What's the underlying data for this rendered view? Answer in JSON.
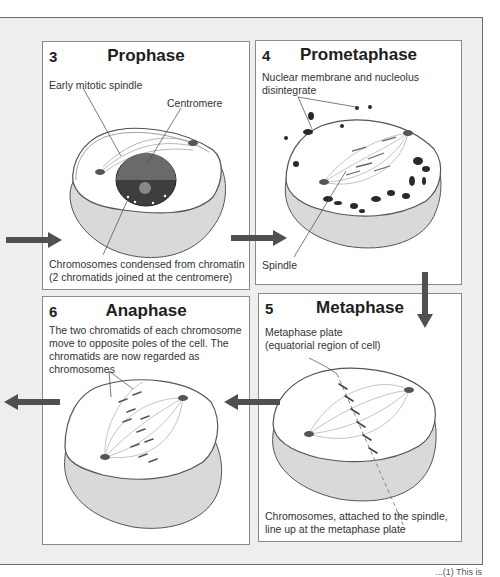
{
  "figure": {
    "panels": [
      {
        "id": "prophase",
        "number": "3",
        "title": "Prophase",
        "labels": {
          "spindle": "Early mitotic spindle",
          "centromere": "Centromere",
          "chromosomes_line1": "Chromosomes condensed from chromatin",
          "chromosomes_line2": "(2 chromatids joined at the centromere)"
        }
      },
      {
        "id": "prometaphase",
        "number": "4",
        "title": "Prometaphase",
        "labels": {
          "membrane_line1": "Nuclear membrane and nucleolus",
          "membrane_line2": "disintegrate",
          "spindle": "Spindle"
        }
      },
      {
        "id": "metaphase",
        "number": "5",
        "title": "Metaphase",
        "labels": {
          "plate_line1": "Metaphase plate",
          "plate_line2": "(equatorial region of cell)",
          "caption_line1": "Chromosomes, attached to the spindle,",
          "caption_line2": "line up at the metaphase plate"
        }
      },
      {
        "id": "anaphase",
        "number": "6",
        "title": "Anaphase",
        "labels": {
          "desc_line1": "The two chromatids of each chromosome",
          "desc_line2": "move to opposite poles of the cell.  The",
          "desc_line3": "chromatids are now regarded as",
          "desc_line4": "chromosomes"
        }
      }
    ],
    "arrows": [
      {
        "id": "into-prophase",
        "direction": "right"
      },
      {
        "id": "prophase-to-prometaphase",
        "direction": "right"
      },
      {
        "id": "prometaphase-to-metaphase",
        "direction": "down"
      },
      {
        "id": "metaphase-to-anaphase",
        "direction": "left"
      },
      {
        "id": "out-of-anaphase",
        "direction": "left"
      }
    ],
    "colors": {
      "arrow": "#505050",
      "frame_bg": "#eeeeec",
      "cell_fill": "#d9d9d9",
      "organelle": "#2a2a2a"
    },
    "footer_fragment": "...(1) This is"
  }
}
